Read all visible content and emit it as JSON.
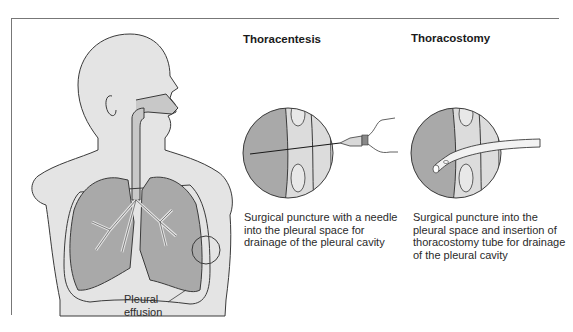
{
  "figure": {
    "body_label_line1": "Pleural",
    "body_label_line2": "effusion",
    "panels": [
      {
        "title": "Thoracentesis",
        "caption_lines": [
          "Surgical puncture with a needle",
          "into the pleural space for",
          "drainage of the pleural cavity"
        ]
      },
      {
        "title": "Thoracostomy",
        "caption_lines": [
          "Surgical puncture into the",
          "pleural space and insertion of",
          "thoracostomy tube for drainage",
          "of the pleural cavity"
        ]
      }
    ],
    "colors": {
      "skin": "#e4e4e4",
      "lung": "#a9a9a9",
      "outline": "#3a3a3a",
      "airway": "#c8c8c8"
    }
  }
}
